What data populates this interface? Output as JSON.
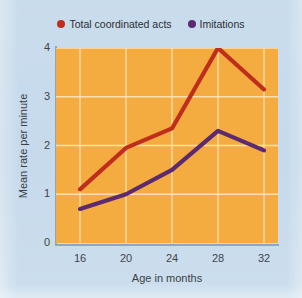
{
  "figure": {
    "background_color": "#c9dcec",
    "plot_background_color": "#f4ab3f",
    "gridline_color": "#ffe0b0",
    "axis_color": "#8fa6bb"
  },
  "legend": {
    "position": "top-center",
    "items": [
      {
        "label": "Total coordinated acts",
        "color": "#bf2e1c",
        "marker": "circle"
      },
      {
        "label": "Imitations",
        "color": "#5b2a70",
        "marker": "circle"
      }
    ]
  },
  "chart_data": {
    "type": "line",
    "title": "",
    "subtitle": "",
    "xlabel": "Age in months",
    "ylabel": "Mean rate per minute",
    "x": [
      16,
      20,
      24,
      28,
      32
    ],
    "categories": [
      "16",
      "20",
      "24",
      "28",
      "32"
    ],
    "xticks": [
      "16",
      "20",
      "24",
      "28",
      "32"
    ],
    "yticks": [
      "0",
      "1",
      "2",
      "3",
      "4"
    ],
    "xlim": [
      14,
      34
    ],
    "ylim": [
      0,
      4
    ],
    "grid": true,
    "legend_position": "top-center",
    "series": [
      {
        "name": "Total coordinated acts",
        "color": "#bf2e1c",
        "values": [
          1.1,
          1.95,
          2.35,
          4.0,
          3.15
        ]
      },
      {
        "name": "Imitations",
        "color": "#5b2a70",
        "values": [
          0.7,
          1.0,
          1.5,
          2.3,
          1.9
        ]
      }
    ]
  }
}
